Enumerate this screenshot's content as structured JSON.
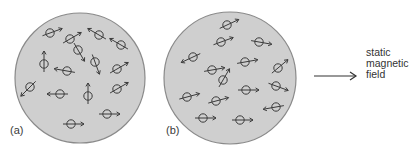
{
  "figure": {
    "panels": [
      {
        "id": "a",
        "label": "(a)",
        "description": "random orientation of magnetic moments",
        "dipole_angles_deg": [
          20,
          30,
          150,
          300,
          150,
          90,
          290,
          170,
          30,
          225,
          180,
          90,
          30,
          0,
          0
        ]
      },
      {
        "id": "b",
        "label": "(b)",
        "description": "moments partially aligned with static magnetic field",
        "dipole_angles_deg": [
          25,
          20,
          350,
          205,
          10,
          10,
          40,
          60,
          0,
          340,
          15,
          15,
          190,
          0,
          0
        ]
      }
    ],
    "field_arrow_label_lines": [
      "static",
      "magnetic",
      "field"
    ],
    "colors": {
      "disc_fill": "#cfcfcf",
      "disc_stroke": "#8a8a8a",
      "dipole_stroke": "#3b3b3b",
      "field_arrow": "#333333"
    }
  }
}
